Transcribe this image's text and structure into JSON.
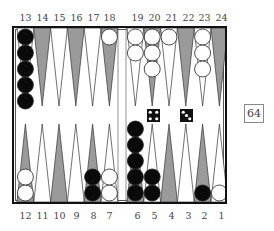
{
  "board": {
    "top_labels": [
      "13",
      "14",
      "15",
      "16",
      "17",
      "18",
      "19",
      "20",
      "21",
      "22",
      "23",
      "24"
    ],
    "bottom_labels": [
      "12",
      "11",
      "10",
      "9",
      "8",
      "7",
      "6",
      "5",
      "4",
      "3",
      "2",
      "1"
    ],
    "points": {
      "13": {
        "color": "black",
        "count": 5
      },
      "18": {
        "color": "white",
        "count": 1
      },
      "19": {
        "color": "white",
        "count": 2
      },
      "20": {
        "color": "white",
        "count": 3
      },
      "21": {
        "color": "white",
        "count": 1
      },
      "23": {
        "color": "white",
        "count": 3
      },
      "12": {
        "color": "white",
        "count": 2
      },
      "8": {
        "color": "black",
        "count": 2
      },
      "7": {
        "color": "white",
        "count": 2
      },
      "6": {
        "color": "black",
        "count": 5
      },
      "5": {
        "color": "black",
        "count": 2
      },
      "2": {
        "color": "black",
        "count": 1
      },
      "1": {
        "color": "white",
        "count": 1
      }
    },
    "dice": [
      4,
      3
    ],
    "cube": "64",
    "colors": {
      "dark_point": "#9a9a9a",
      "light_point": "#ffffff",
      "black_checker": "#0a0a0a",
      "white_checker": "#ffffff",
      "frame": "#111111"
    }
  }
}
